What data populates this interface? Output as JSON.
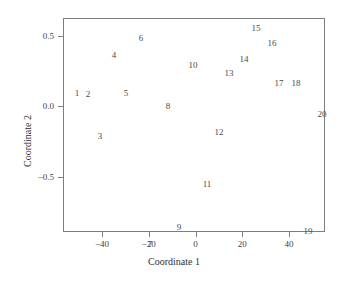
{
  "chart_data": {
    "type": "scatter",
    "title": "",
    "xlabel": "Coordinate 1",
    "ylabel": "Coordinate 2",
    "xlim": [
      -56.7,
      55.4
    ],
    "ylim": [
      -0.895,
      0.63
    ],
    "xticks": [
      -40,
      -20,
      0,
      20,
      40
    ],
    "xticklabels": [
      "−40",
      "−20",
      "0",
      "20",
      "40"
    ],
    "yticks": [
      0.5,
      0.0,
      -0.5
    ],
    "yticklabels": [
      "0.5",
      "0.0",
      "−0.5"
    ],
    "grid": false,
    "legend": null,
    "marker_style": "text-label",
    "points": [
      {
        "label": "1",
        "x": -50.7,
        "y": 0.092
      },
      {
        "label": "2",
        "x": -46.0,
        "y": 0.085
      },
      {
        "label": "3",
        "x": -40.9,
        "y": -0.208
      },
      {
        "label": "4",
        "x": -34.9,
        "y": 0.369
      },
      {
        "label": "5",
        "x": -29.7,
        "y": 0.092
      },
      {
        "label": "6",
        "x": -23.3,
        "y": 0.485
      },
      {
        "label": "7",
        "x": -19.5,
        "y": -0.977
      },
      {
        "label": "8",
        "x": -11.8,
        "y": 0.0
      },
      {
        "label": "9",
        "x": -7.1,
        "y": -0.862
      },
      {
        "label": "10",
        "x": -1.1,
        "y": 0.292
      },
      {
        "label": "11",
        "x": 4.9,
        "y": -0.554
      },
      {
        "label": "12",
        "x": 10.1,
        "y": -0.185
      },
      {
        "label": "13",
        "x": 14.3,
        "y": 0.238
      },
      {
        "label": "14",
        "x": 20.7,
        "y": 0.338
      },
      {
        "label": "15",
        "x": 25.9,
        "y": 0.562
      },
      {
        "label": "16",
        "x": 32.7,
        "y": 0.454
      },
      {
        "label": "17",
        "x": 35.7,
        "y": 0.169
      },
      {
        "label": "18",
        "x": 43.0,
        "y": 0.169
      },
      {
        "label": "20",
        "x": 54.1,
        "y": -0.054
      },
      {
        "label": "19",
        "x": 48.1,
        "y": -0.885
      }
    ]
  }
}
